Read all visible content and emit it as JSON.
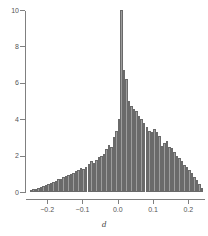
{
  "chart_data": {
    "type": "bar",
    "title": "",
    "subtitle": "",
    "xlabel": "d",
    "ylabel": "",
    "xlim": [
      -0.26,
      0.25
    ],
    "ylim": [
      0,
      10
    ],
    "grid": false,
    "legend": null,
    "bar_fill_color": "#9d9d9d",
    "bar_stroke_color": "#6a6a6a",
    "axis_color": "#808080",
    "background_color": "#ffffff",
    "xticks": [
      -0.2,
      -0.1,
      0.0,
      0.1,
      0.2
    ],
    "xtick_labels": [
      "-0.2",
      "-0.1",
      "0.0",
      "0.1",
      "0.2"
    ],
    "yticks": [
      0,
      2,
      4,
      6,
      8,
      10
    ],
    "ytick_labels": [
      "0",
      "2",
      "4",
      "6",
      "8",
      "10"
    ],
    "bin_width": 0.00714,
    "x": [
      -0.25,
      -0.2429,
      -0.2357,
      -0.2286,
      -0.2214,
      -0.2143,
      -0.2071,
      -0.2,
      -0.1929,
      -0.1857,
      -0.1786,
      -0.1714,
      -0.1643,
      -0.1571,
      -0.15,
      -0.1429,
      -0.1357,
      -0.1286,
      -0.1214,
      -0.1143,
      -0.1071,
      -0.1,
      -0.0929,
      -0.0857,
      -0.0786,
      -0.0714,
      -0.0643,
      -0.0571,
      -0.05,
      -0.0429,
      -0.0357,
      -0.0286,
      -0.0214,
      -0.0143,
      -0.0071,
      0.0,
      0.0071,
      0.0143,
      0.0214,
      0.0286,
      0.0357,
      0.0429,
      0.05,
      0.0571,
      0.0643,
      0.0714,
      0.0786,
      0.0857,
      0.0929,
      0.1,
      0.1071,
      0.1143,
      0.1214,
      0.1286,
      0.1357,
      0.1429,
      0.15,
      0.1571,
      0.1643,
      0.1714,
      0.1786,
      0.1857,
      0.1929,
      0.2,
      0.2071,
      0.2143,
      0.2214,
      0.2286,
      0.2357
    ],
    "values": [
      0.1,
      0.15,
      0.18,
      0.22,
      0.28,
      0.32,
      0.38,
      0.45,
      0.5,
      0.55,
      0.62,
      0.7,
      0.72,
      0.8,
      0.88,
      0.95,
      1.0,
      1.05,
      1.15,
      1.2,
      1.3,
      1.25,
      1.4,
      1.55,
      1.7,
      1.6,
      1.75,
      1.95,
      2.0,
      2.1,
      2.35,
      2.6,
      2.5,
      3.0,
      3.35,
      4.0,
      10.0,
      6.7,
      6.2,
      5.0,
      4.7,
      4.55,
      4.45,
      4.2,
      4.0,
      3.8,
      3.55,
      3.35,
      3.3,
      3.45,
      3.3,
      3.1,
      2.55,
      2.7,
      2.8,
      2.45,
      2.4,
      2.2,
      2.0,
      1.85,
      1.7,
      1.5,
      1.35,
      1.2,
      1.05,
      0.85,
      0.65,
      0.45,
      0.22
    ],
    "annotations": []
  }
}
